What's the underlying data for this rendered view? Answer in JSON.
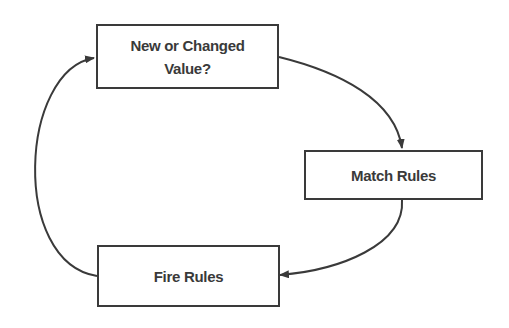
{
  "diagram": {
    "type": "cycle-flow",
    "nodes": [
      {
        "id": "new-or-changed",
        "lines": [
          "New or Changed",
          "Value?"
        ]
      },
      {
        "id": "match-rules",
        "lines": [
          "Match Rules"
        ]
      },
      {
        "id": "fire-rules",
        "lines": [
          "Fire Rules"
        ]
      }
    ],
    "edges": [
      {
        "from": "new-or-changed",
        "to": "match-rules"
      },
      {
        "from": "match-rules",
        "to": "fire-rules"
      },
      {
        "from": "fire-rules",
        "to": "new-or-changed"
      }
    ],
    "colors": {
      "stroke": "#3a3a3a",
      "text": "#3a3a3a",
      "background": "#ffffff"
    }
  }
}
